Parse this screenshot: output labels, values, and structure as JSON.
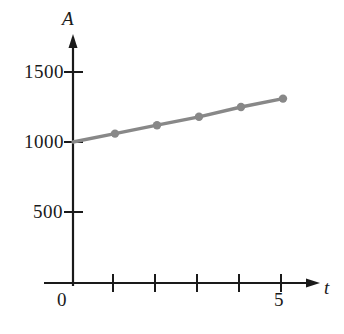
{
  "figure": {
    "kind": "line-graph",
    "background_color": "#ffffff"
  },
  "axes": {
    "y_axis_name": "A",
    "x_axis_name": "t",
    "origin_label": "0",
    "axis_color": "#1a1a1a",
    "y_ticks": [
      {
        "label": "1500",
        "value": 1500
      },
      {
        "label": "1000",
        "value": 1000
      },
      {
        "label": "500",
        "value": 500
      }
    ],
    "x_ticks": [
      {
        "label": "",
        "value": 1
      },
      {
        "label": "",
        "value": 2
      },
      {
        "label": "",
        "value": 3
      },
      {
        "label": "",
        "value": 4
      },
      {
        "label": "5",
        "value": 5
      }
    ]
  },
  "chart_data": {
    "type": "line",
    "title": "",
    "xlabel": "t",
    "ylabel": "A",
    "xlim": [
      0,
      5.6
    ],
    "ylim": [
      0,
      1650
    ],
    "grid": false,
    "legend": false,
    "series_color": "#888888",
    "marker": "circle",
    "x": [
      0,
      1,
      2,
      3,
      4,
      5
    ],
    "values": [
      1000,
      1060,
      1120,
      1180,
      1250,
      1310
    ],
    "series": [
      {
        "name": "A",
        "color": "#888888",
        "values": [
          1000,
          1060,
          1120,
          1180,
          1250,
          1310
        ]
      }
    ],
    "ytick_values": [
      500,
      1000,
      1500
    ],
    "ytick_labels": [
      "500",
      "1000",
      "1500"
    ],
    "xtick_values": [
      1,
      2,
      3,
      4,
      5
    ],
    "xtick_labels": [
      "",
      "",
      "",
      "",
      "5"
    ]
  }
}
